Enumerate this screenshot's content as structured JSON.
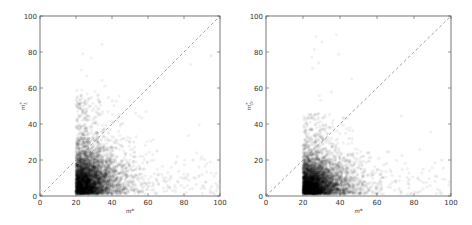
{
  "chart_data": [
    {
      "type": "scatter",
      "title": "",
      "xlabel": "m*",
      "ylabel": "m_L*",
      "xlim": [
        0,
        100
      ],
      "ylim": [
        0,
        100
      ],
      "xticks": [
        0,
        20,
        40,
        60,
        80,
        100
      ],
      "yticks": [
        0,
        20,
        40,
        60,
        80,
        100
      ],
      "grid": false,
      "legend": null,
      "reference_line": {
        "style": "dashed",
        "color": "#888888",
        "from": [
          0,
          0
        ],
        "to": [
          100,
          100
        ],
        "label": "y = x"
      },
      "marker": {
        "color": "#000000",
        "alpha": 0.06,
        "size": 3
      },
      "distribution": {
        "x_min": 20,
        "x_mode": 25,
        "x_tail_max": 100,
        "y_min": 1,
        "y_mode": 12,
        "y_dense_max": 35,
        "y_tail_max": 55,
        "description": "Dense cloud with sharp left edge at m*=20, densest for x in 20-35 and y in 2-30, sparse tail to x~100"
      },
      "sample_points": [
        [
          21,
          5
        ],
        [
          22,
          12
        ],
        [
          24,
          18
        ],
        [
          26,
          8
        ],
        [
          28,
          22
        ],
        [
          30,
          15
        ],
        [
          32,
          28
        ],
        [
          35,
          10
        ],
        [
          38,
          35
        ],
        [
          42,
          20
        ],
        [
          45,
          40
        ],
        [
          48,
          12
        ],
        [
          52,
          30
        ],
        [
          58,
          15
        ],
        [
          65,
          25
        ],
        [
          72,
          5
        ],
        [
          85,
          20
        ],
        [
          95,
          78
        ]
      ]
    },
    {
      "type": "scatter",
      "title": "",
      "xlabel": "m*",
      "ylabel": "m_D*",
      "xlim": [
        0,
        100
      ],
      "ylim": [
        0,
        100
      ],
      "xticks": [
        0,
        20,
        40,
        60,
        80,
        100
      ],
      "yticks": [
        0,
        20,
        40,
        60,
        80,
        100
      ],
      "grid": false,
      "legend": null,
      "reference_line": {
        "style": "dashed",
        "color": "#888888",
        "from": [
          0,
          0
        ],
        "to": [
          100,
          100
        ],
        "label": "y = x"
      },
      "marker": {
        "color": "#000000",
        "alpha": 0.06,
        "size": 3
      },
      "distribution": {
        "x_min": 20,
        "x_mode": 25,
        "x_tail_max": 100,
        "y_min": 1,
        "y_mode": 10,
        "y_dense_max": 28,
        "y_tail_max": 45,
        "description": "Dense cloud with sharp left edge at m*=20, densest for x in 20-35 and y in 2-25, sparse tail to x~100"
      },
      "sample_points": [
        [
          21,
          4
        ],
        [
          22,
          10
        ],
        [
          24,
          15
        ],
        [
          26,
          6
        ],
        [
          28,
          18
        ],
        [
          30,
          12
        ],
        [
          32,
          22
        ],
        [
          35,
          8
        ],
        [
          38,
          28
        ],
        [
          42,
          15
        ],
        [
          45,
          32
        ],
        [
          48,
          10
        ],
        [
          52,
          22
        ],
        [
          58,
          12
        ],
        [
          65,
          18
        ],
        [
          72,
          4
        ],
        [
          85,
          15
        ],
        [
          95,
          20
        ]
      ]
    }
  ],
  "panels": [
    {
      "xlabel": "m*",
      "ylabel_base": "m",
      "ylabel_sub": "L",
      "ylabel_sup": "*",
      "xtick_labels": [
        "0",
        "20",
        "40",
        "60",
        "80",
        "100"
      ],
      "ytick_labels": [
        "0",
        "20",
        "40",
        "60",
        "80",
        "100"
      ]
    },
    {
      "xlabel": "m*",
      "ylabel_base": "m",
      "ylabel_sub": "D",
      "ylabel_sup": "*",
      "xtick_labels": [
        "0",
        "20",
        "40",
        "60",
        "80",
        "100"
      ],
      "ytick_labels": [
        "0",
        "20",
        "40",
        "60",
        "80",
        "100"
      ]
    }
  ]
}
